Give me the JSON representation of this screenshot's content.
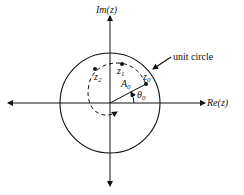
{
  "diagram": {
    "axes": {
      "vertical_label": "Im(z)",
      "horizontal_label": "Re(z)"
    },
    "annotations": {
      "circle_label": "unit circle",
      "magnitude_label": "A",
      "magnitude_sub": "0",
      "angle_label": "θ",
      "angle_sub": "0"
    },
    "points": [
      {
        "name": "z",
        "sub": "0"
      },
      {
        "name": "z",
        "sub": "1"
      },
      {
        "name": "z",
        "sub": "2"
      }
    ],
    "colors": {
      "ink": "#111111",
      "background": "#ffffff"
    }
  }
}
